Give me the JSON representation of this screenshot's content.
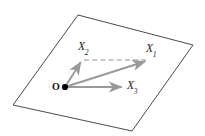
{
  "figure": {
    "type": "vector-diagram",
    "canvas": {
      "width": 205,
      "height": 136,
      "background": "#ffffff"
    },
    "colors": {
      "plane_stroke": "#4a4a4a",
      "vector_stroke": "#9a9a9a",
      "dashed_stroke": "#8f8f8f",
      "origin_dot": "#000000",
      "label_text": "#1b1b1b"
    },
    "plane": {
      "name": "plane-parallelogram",
      "points": "78,15 193,45 132,131 13,105",
      "stroke_width": 1.0
    },
    "origin": {
      "label": "O",
      "x": 65,
      "y": 87,
      "dot_radius": 3.1
    },
    "vectors": [
      {
        "id": "x1",
        "label": "X",
        "subscript": "1",
        "from": {
          "x": 65,
          "y": 87
        },
        "to": {
          "x": 148,
          "y": 60.5
        },
        "style": "solid"
      },
      {
        "id": "x2",
        "label": "X",
        "subscript": "2",
        "from": {
          "x": 65,
          "y": 87
        },
        "to": {
          "x": 82,
          "y": 59.5
        },
        "style": "solid"
      },
      {
        "id": "x3",
        "label": "X",
        "subscript": "3",
        "from": {
          "x": 65,
          "y": 87
        },
        "to": {
          "x": 124.5,
          "y": 87
        },
        "style": "solid"
      }
    ],
    "construction_line": {
      "id": "dashed-x2-to-x1",
      "from": {
        "x": 84,
        "y": 60
      },
      "to": {
        "x": 146,
        "y": 60
      },
      "style": "dashed",
      "dash_pattern": "5,3.2"
    }
  }
}
